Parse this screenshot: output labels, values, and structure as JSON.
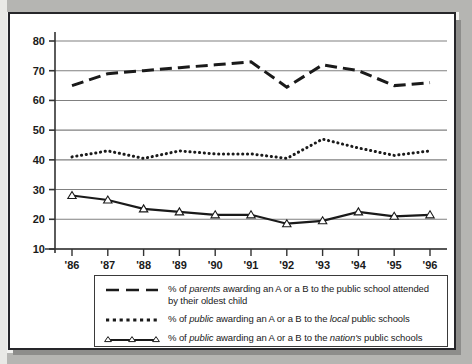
{
  "chart_data": {
    "type": "line",
    "title": "",
    "xlabel": "",
    "ylabel": "",
    "categories": [
      "'86",
      "'87",
      "'88",
      "'89",
      "'90",
      "'91",
      "'92",
      "'93",
      "'94",
      "'95",
      "'96"
    ],
    "ylim": [
      10,
      80
    ],
    "yticks": [
      10,
      20,
      30,
      40,
      50,
      60,
      70,
      80
    ],
    "grid": true,
    "legend_position": "below-plot",
    "series": [
      {
        "name": "% of parents awarding an A or a B to the public school attended by their oldest child",
        "style": "dashed",
        "marker": "none",
        "values": [
          65,
          69,
          70,
          71,
          72,
          73,
          64.5,
          72,
          70,
          65,
          66
        ]
      },
      {
        "name": "% of public awarding an A or a B to the local public schools",
        "style": "dotted",
        "marker": "none",
        "values": [
          41,
          43,
          40.5,
          43,
          42,
          42,
          40.5,
          47,
          44,
          41.5,
          43
        ]
      },
      {
        "name": "% of public awarding an A or a B to the nation's public schools",
        "style": "solid",
        "marker": "triangle",
        "values": [
          28,
          26.5,
          23.5,
          22.5,
          21.5,
          21.5,
          18.5,
          19.5,
          22.5,
          21,
          21.5
        ]
      }
    ]
  },
  "axis": {
    "y_labels": [
      "80",
      "70",
      "60",
      "50",
      "40",
      "30",
      "20",
      "10"
    ],
    "x_labels": [
      "'86",
      "'87",
      "'88",
      "'89",
      "'90",
      "'91",
      "'92",
      "'93",
      "'94",
      "'95",
      "'96"
    ]
  },
  "legend": {
    "items": [
      {
        "sample": "dashed-line-sample",
        "line1_a": "% of ",
        "line1_em": "parents",
        "line1_b": " awarding an A or a B to the public school attended",
        "line2": "by their oldest child"
      },
      {
        "sample": "dotted-line-sample",
        "a": "% of ",
        "em1": "public",
        "b": " awarding an A or a B to the ",
        "em2": "local",
        "c": " public schools"
      },
      {
        "sample": "triangle-line-sample",
        "a": "% of ",
        "em1": "public",
        "b": " awarding an A or a B to the ",
        "em2": "nation's",
        "c": " public schools"
      }
    ]
  },
  "colors": {
    "line": "#1a1a1a",
    "grid": "#808080",
    "axis": "#333333",
    "frame": "#26262a",
    "page_bg": "#b5b5b2",
    "panel_bg": "#ffffff"
  }
}
